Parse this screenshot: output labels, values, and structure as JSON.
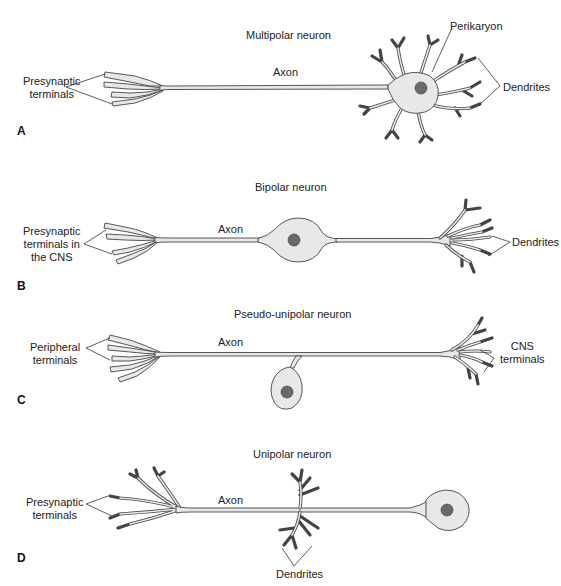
{
  "colors": {
    "background": "#ffffff",
    "cell_fill": "#e8e8e8",
    "outline": "#444444",
    "nucleus": "#6a6a6a",
    "text": "#222222"
  },
  "panels": [
    {
      "letter": "A",
      "title": "Multipolar neuron",
      "labels": {
        "left": "Presynaptic\nterminals",
        "left_line1": "Presynaptic",
        "left_line2": "terminals",
        "axon": "Axon",
        "perikaryon": "Perikaryon",
        "right": "Dendrites"
      }
    },
    {
      "letter": "B",
      "title": "Bipolar neuron",
      "labels": {
        "left_line1": "Presynaptic",
        "left_line2": "terminals in",
        "left_line3": "the CNS",
        "axon": "Axon",
        "right": "Dendrites"
      }
    },
    {
      "letter": "C",
      "title": "Pseudo-unipolar neuron",
      "labels": {
        "left_line1": "Peripheral",
        "left_line2": "terminals",
        "axon": "Axon",
        "right_line1": "CNS",
        "right_line2": "terminals"
      }
    },
    {
      "letter": "D",
      "title": "Unipolar neuron",
      "labels": {
        "left_line1": "Presynaptic",
        "left_line2": "terminals",
        "axon": "Axon",
        "bottom": "Dendrites"
      }
    }
  ]
}
